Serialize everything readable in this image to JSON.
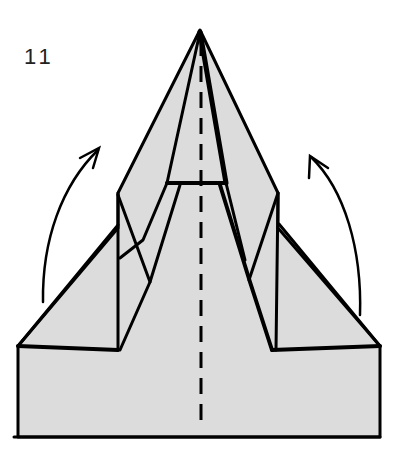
{
  "diagram": {
    "type": "origami-folding-step",
    "step_number": "11",
    "colors": {
      "paper_fill": "#dcdcdc",
      "line": "#000000",
      "background": "#ffffff"
    },
    "elements": {
      "model": "paper airplane (partially folded)",
      "fold_line": "dashed vertical center valley fold",
      "arrows": [
        {
          "name": "left-wing-fold-arrow",
          "direction": "up"
        },
        {
          "name": "right-wing-fold-arrow",
          "direction": "up"
        }
      ]
    }
  }
}
